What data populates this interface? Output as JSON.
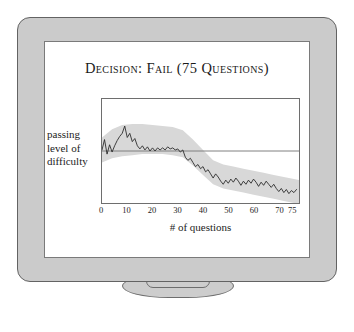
{
  "figure": {
    "device": "computer-monitor",
    "device_parts": {
      "bezel": "monitor-bezel",
      "screen": "monitor-screen",
      "neck": "monitor-neck",
      "base": "monitor-base"
    }
  },
  "colors": {
    "bezel_fill": "#cbcbcb",
    "bezel_stroke": "#636363",
    "screen_fill": "#ffffff",
    "screen_stroke": "#7a7a7a",
    "band_fill": "#d8d8d8",
    "line_stroke": "#2b2b2b",
    "reference_line": "#7e7e7e",
    "text": "#1a1a1a"
  },
  "chart_data": {
    "type": "line",
    "title": "Decision: Fail (75 Questions)",
    "xlabel": "# of questions",
    "ylabel": "passing level of difficulty",
    "ylabel_lines": [
      "passing",
      "level of",
      "difficulty"
    ],
    "grid": false,
    "legend": null,
    "xlim": [
      0,
      78
    ],
    "ylim": [
      -1.0,
      1.0
    ],
    "xticks": [
      0,
      10,
      20,
      30,
      40,
      50,
      60,
      70,
      75
    ],
    "xtick_labels": [
      "0",
      "10",
      "20",
      "30",
      "40",
      "50",
      "60",
      "70",
      "75"
    ],
    "yticks": [],
    "ytick_labels": [],
    "reference_line": {
      "name": "passing level of difficulty",
      "orientation": "horizontal",
      "y": 0
    },
    "series": [
      {
        "name": "ability estimate",
        "style": "jagged-line",
        "x": [
          0,
          1,
          2,
          3,
          4,
          5,
          6,
          7,
          8,
          9,
          10,
          11,
          12,
          13,
          14,
          15,
          16,
          17,
          18,
          19,
          20,
          21,
          22,
          23,
          24,
          25,
          26,
          27,
          28,
          29,
          30,
          31,
          32,
          33,
          34,
          35,
          36,
          37,
          38,
          39,
          40,
          41,
          42,
          43,
          44,
          45,
          46,
          47,
          48,
          49,
          50,
          51,
          52,
          53,
          54,
          55,
          56,
          57,
          58,
          59,
          60,
          61,
          62,
          63,
          64,
          65,
          66,
          67,
          68,
          69,
          70,
          71,
          72,
          73,
          74,
          75,
          76,
          77
        ],
        "y": [
          0.02,
          0.22,
          -0.06,
          0.12,
          -0.02,
          0.1,
          0.2,
          0.28,
          0.34,
          0.48,
          0.26,
          0.34,
          0.18,
          0.24,
          0.1,
          0.04,
          0.1,
          0.02,
          0.08,
          0.0,
          0.06,
          0.0,
          0.06,
          0.02,
          0.06,
          0.02,
          0.08,
          0.04,
          0.06,
          0.02,
          0.04,
          -0.02,
          0.02,
          -0.12,
          -0.18,
          -0.14,
          -0.22,
          -0.3,
          -0.26,
          -0.34,
          -0.3,
          -0.4,
          -0.36,
          -0.44,
          -0.52,
          -0.44,
          -0.5,
          -0.58,
          -0.64,
          -0.56,
          -0.62,
          -0.54,
          -0.6,
          -0.52,
          -0.58,
          -0.66,
          -0.58,
          -0.64,
          -0.56,
          -0.62,
          -0.54,
          -0.6,
          -0.68,
          -0.6,
          -0.66,
          -0.58,
          -0.64,
          -0.7,
          -0.64,
          -0.72,
          -0.78,
          -0.72,
          -0.8,
          -0.74,
          -0.82,
          -0.76,
          -0.8,
          -0.74
        ]
      }
    ],
    "band": {
      "name": "confidence band",
      "x": [
        0,
        4,
        8,
        12,
        16,
        20,
        24,
        28,
        32,
        36,
        40,
        44,
        48,
        52,
        56,
        60,
        64,
        68,
        72,
        76,
        78
      ],
      "upper": [
        0.26,
        0.42,
        0.5,
        0.52,
        0.52,
        0.5,
        0.48,
        0.46,
        0.4,
        0.22,
        0.02,
        -0.18,
        -0.26,
        -0.3,
        -0.34,
        -0.38,
        -0.42,
        -0.46,
        -0.5,
        -0.54,
        -0.56
      ],
      "lower": [
        -0.22,
        -0.14,
        -0.1,
        -0.08,
        -0.06,
        -0.06,
        -0.06,
        -0.08,
        -0.12,
        -0.28,
        -0.46,
        -0.64,
        -0.72,
        -0.76,
        -0.8,
        -0.84,
        -0.88,
        -0.92,
        -0.96,
        -1.0,
        -1.02
      ]
    }
  }
}
